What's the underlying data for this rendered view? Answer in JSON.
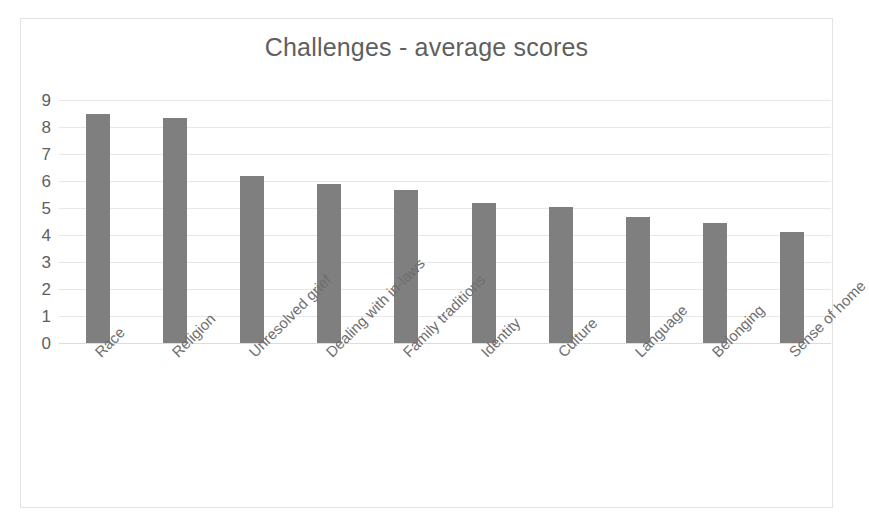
{
  "chart_data": {
    "type": "bar",
    "title": "Challenges - average scores",
    "xlabel": "",
    "ylabel": "",
    "ylim": [
      0,
      9
    ],
    "ytick_labels": [
      "9",
      "8",
      "7",
      "6",
      "5",
      "4",
      "3",
      "2",
      "1",
      "0"
    ],
    "grid": true,
    "legend": "none",
    "bar_color": "#7f7f7f",
    "title_color": "#5f5f5f",
    "axis_text_color": "#6e6e6e",
    "gridline_color": "#e8e8e8",
    "frame_border_color": "#e3e3e3",
    "categories": [
      "Race",
      "Religion",
      "Unresolved grief",
      "Dealing with in-laws",
      "Family traditions",
      "Identity",
      "Culture",
      "Language",
      "Belonging",
      "Sense of home"
    ],
    "values": [
      8.5,
      8.35,
      6.2,
      5.9,
      5.65,
      5.2,
      5.05,
      4.65,
      4.45,
      4.1
    ]
  }
}
